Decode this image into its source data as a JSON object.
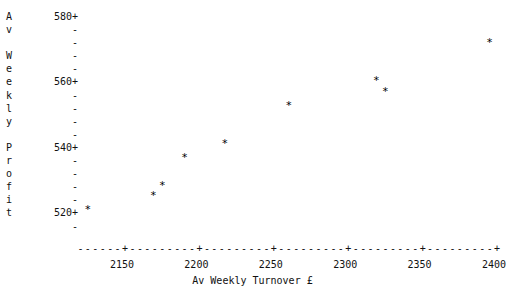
{
  "chart_data": {
    "type": "scatter",
    "title": "",
    "xlabel": "Av Weekly Turnover £",
    "ylabel": "Av Weekly Profit",
    "xlim": [
      2120,
      2410
    ],
    "ylim": [
      518,
      582
    ],
    "xticks": [
      2150,
      2200,
      2250,
      2300,
      2350,
      2400
    ],
    "xtick_labels": [
      "2150",
      "2200",
      "2250",
      "2300",
      "2350",
      "2400"
    ],
    "yticks": [
      520,
      540,
      560,
      580
    ],
    "ytick_labels": [
      "520+",
      "540+",
      "560+",
      "580+"
    ],
    "y_minor_tick_glyph": "-",
    "y_major_tick_glyph": "+",
    "minor_ticks_per_major": 4,
    "grid": false,
    "legend": null,
    "marker": "*",
    "marker_color": "#000000",
    "points": [
      {
        "x": 2127,
        "y": 524
      },
      {
        "x": 2171,
        "y": 528
      },
      {
        "x": 2177,
        "y": 531
      },
      {
        "x": 2192,
        "y": 539
      },
      {
        "x": 2219,
        "y": 543
      },
      {
        "x": 2262,
        "y": 554
      },
      {
        "x": 2327,
        "y": 558
      },
      {
        "x": 2321,
        "y": 561
      },
      {
        "x": 2397,
        "y": 572
      }
    ],
    "x_axis_line": "+---------+---------+---------+---------+---------+",
    "x_axis_leader": "------"
  },
  "y_caption_chars": [
    "A",
    "v",
    "",
    "W",
    "e",
    "e",
    "k",
    "l",
    "y",
    "",
    "P",
    "r",
    "o",
    "f",
    "i",
    "t"
  ],
  "y_axis_rows": [
    "580+",
    "-",
    "-",
    "-",
    "-",
    "560+",
    "-",
    "-",
    "-",
    "-",
    "540+",
    "-",
    "-",
    "-",
    "-",
    "520+",
    "-"
  ]
}
